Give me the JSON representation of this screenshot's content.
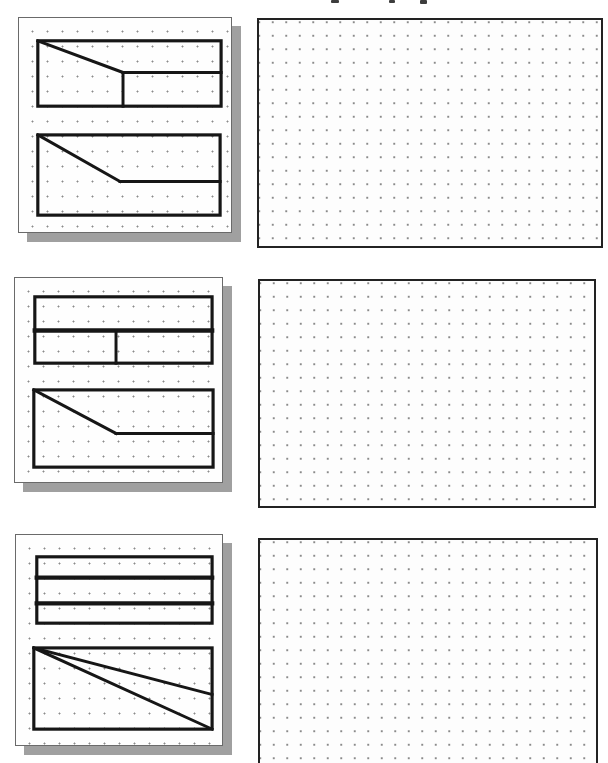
{
  "page": {
    "width": 608,
    "height": 763,
    "background": "#ffffff"
  },
  "style": {
    "figure_stroke": "#161616",
    "figure_stroke_width": 3,
    "outline_stroke_width": 3.2,
    "card_background": "#fefefe",
    "card_border": "#6a6a6a",
    "card_shadow": "#a0a0a0",
    "panel_background": "#fdfdfd",
    "panel_border": "#222222",
    "dot_color": "#8a8a8a"
  },
  "cropped_heading_remnant": {
    "marks": [
      {
        "x": 331,
        "y": 0,
        "w": 8,
        "h": 3
      },
      {
        "x": 389,
        "y": 0,
        "w": 6,
        "h": 3
      },
      {
        "x": 420,
        "y": 0,
        "w": 7,
        "h": 4
      }
    ]
  },
  "rows": [
    {
      "id": "exercise-1",
      "left_card": {
        "x": 18,
        "y": 17,
        "w": 214,
        "h": 216,
        "shapes": [
          {
            "name": "upper-view",
            "rect": [
              19,
              23,
              185,
              66
            ],
            "lines": [
              {
                "pts": [
                  19,
                  23,
                  105,
                  55
                ]
              },
              {
                "pts": [
                  105,
                  55,
                  105,
                  89
                ]
              },
              {
                "pts": [
                  105,
                  55,
                  204,
                  55
                ]
              }
            ]
          },
          {
            "name": "lower-view",
            "rect": [
              19,
              118,
              184,
              81
            ],
            "lines": [
              {
                "pts": [
                  19,
                  118,
                  102,
                  165
                ]
              },
              {
                "pts": [
                  102,
                  165,
                  203,
                  165
                ]
              }
            ]
          }
        ]
      },
      "right_panel": {
        "name": "blank-sketching-grid",
        "x": 257,
        "y": 18,
        "w": 346,
        "h": 230,
        "clipped_bottom": false
      }
    },
    {
      "id": "exercise-2",
      "left_card": {
        "x": 14,
        "y": 277,
        "w": 209,
        "h": 206,
        "shapes": [
          {
            "name": "upper-view",
            "rect": [
              20,
              19,
              179,
              67
            ],
            "lines": [
              {
                "pts": [
                  20,
                  53,
                  199,
                  53
                ],
                "sw": 4.5
              },
              {
                "pts": [
                  102,
                  53,
                  102,
                  86
                ]
              }
            ]
          },
          {
            "name": "lower-view",
            "rect": [
              19,
              113,
              181,
              78
            ],
            "lines": [
              {
                "pts": [
                  19,
                  113,
                  102,
                  157
                ]
              },
              {
                "pts": [
                  102,
                  157,
                  200,
                  157
                ]
              }
            ]
          }
        ]
      },
      "right_panel": {
        "name": "blank-sketching-grid",
        "x": 258,
        "y": 279,
        "w": 338,
        "h": 229,
        "clipped_bottom": false
      }
    },
    {
      "id": "exercise-3",
      "left_card": {
        "x": 15,
        "y": 534,
        "w": 208,
        "h": 212,
        "shapes": [
          {
            "name": "upper-view",
            "rect": [
              21,
              22,
              177,
              67
            ],
            "lines": [
              {
                "pts": [
                  21,
                  43,
                  198,
                  43
                ],
                "sw": 4.5
              },
              {
                "pts": [
                  21,
                  69,
                  198,
                  69
                ],
                "sw": 4.5
              }
            ]
          },
          {
            "name": "lower-view",
            "rect": [
              18,
              114,
              180,
              82
            ],
            "lines": [
              {
                "pts": [
                  18,
                  114,
                  198,
                  161
                ]
              },
              {
                "pts": [
                  18,
                  114,
                  198,
                  196
                ]
              }
            ]
          }
        ]
      },
      "right_panel": {
        "name": "blank-sketching-grid",
        "x": 258,
        "y": 538,
        "w": 340,
        "h": 225,
        "clipped_bottom": true
      }
    }
  ]
}
